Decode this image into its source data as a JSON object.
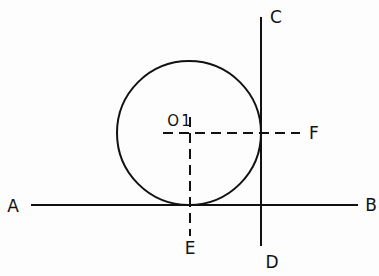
{
  "diagram": {
    "colors": {
      "stroke": "#111111",
      "background": "#fdfdfd"
    },
    "circle": {
      "center_label": "O1",
      "cx": 189,
      "cy": 133,
      "r": 72
    },
    "lines": [
      {
        "id": "AB",
        "style": "solid",
        "x1": 31,
        "y1": 205,
        "x2": 358,
        "y2": 205
      },
      {
        "id": "CD",
        "style": "solid",
        "x1": 261,
        "y1": 17,
        "x2": 261,
        "y2": 246
      },
      {
        "id": "O1F",
        "style": "dashed",
        "x1": 163,
        "y1": 133,
        "x2": 300,
        "y2": 133
      },
      {
        "id": "O1E",
        "style": "dashed",
        "x1": 190,
        "y1": 117,
        "x2": 190,
        "y2": 236
      }
    ],
    "labels": {
      "A": "A",
      "B": "B",
      "C": "C",
      "D": "D",
      "E": "E",
      "F": "F",
      "O1": "O1"
    }
  }
}
